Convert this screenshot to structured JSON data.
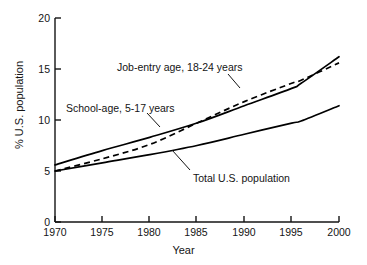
{
  "chart_data": {
    "type": "line",
    "title": "",
    "xlabel": "Year",
    "ylabel": "% U.S. population",
    "xlim": [
      1970,
      2000
    ],
    "ylim": [
      0,
      20
    ],
    "xticks": [
      1970,
      1975,
      1980,
      1985,
      1990,
      1995,
      2000
    ],
    "yticks": [
      0,
      5,
      10,
      15,
      20
    ],
    "grid": false,
    "legend_position": "inline-annotations",
    "x": [
      1970,
      1975,
      1980,
      1985,
      1990,
      1995,
      1996,
      2000
    ],
    "series": [
      {
        "name": "School-age, 5-17 years",
        "style": "solid",
        "color": "#000000",
        "values": [
          5.6,
          7.0,
          8.3,
          9.7,
          11.4,
          13.1,
          13.6,
          16.2
        ]
      },
      {
        "name": "Job-entry age, 18-24 years",
        "style": "dashed",
        "color": "#000000",
        "values": [
          5.0,
          6.2,
          7.6,
          9.7,
          11.8,
          13.6,
          13.9,
          15.6
        ]
      },
      {
        "name": "Total U.S. population",
        "style": "solid",
        "color": "#000000",
        "values": [
          5.0,
          5.8,
          6.6,
          7.5,
          8.6,
          9.7,
          9.9,
          11.4
        ]
      }
    ],
    "annotations": [
      {
        "name": "job-entry-label",
        "text": "Job-entry age, 18-24 years",
        "x_px": 117,
        "y_px": 62
      },
      {
        "name": "school-age-label",
        "text": "School-age, 5-17 years",
        "x_px": 66,
        "y_px": 103
      },
      {
        "name": "total-population-label",
        "text": "Total U.S. population",
        "x_px": 193,
        "y_px": 173
      }
    ]
  },
  "axes": {
    "x_title": "Year",
    "y_title": "% U.S. population",
    "x_tick_labels": [
      "1970",
      "1975",
      "1980",
      "1985",
      "1990",
      "1995",
      "2000"
    ],
    "y_tick_labels": [
      "0",
      "5",
      "10",
      "15",
      "20"
    ]
  }
}
